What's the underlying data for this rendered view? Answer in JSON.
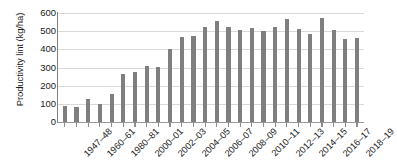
{
  "chart_data": {
    "type": "bar",
    "title": "",
    "xlabel": "",
    "ylabel": "Productivity lint (kg/ha)",
    "ylim": [
      0,
      600
    ],
    "yticks": [
      0,
      100,
      200,
      300,
      400,
      500,
      600
    ],
    "ytick_labels": [
      "0",
      "100",
      "200",
      "300",
      "400",
      "500",
      "600"
    ],
    "grid": true,
    "legend": "none",
    "bar_color": "#7f7f7f",
    "label_every_n_categories": 2,
    "categories": [
      "1947–48",
      "1950–51",
      "1960–61",
      "1970–71",
      "1980–81",
      "1990–91",
      "2000–01",
      "2001–02",
      "2002–03",
      "2003–04",
      "2004–05",
      "2005–06",
      "2006–07",
      "2007–08",
      "2008–09",
      "2009–10",
      "2010–11",
      "2011–12",
      "2012–13",
      "2013–14",
      "2014–15",
      "2015–16",
      "2016–17",
      "2017–18",
      "2018–19",
      "2019–20"
    ],
    "visible_tick_labels": [
      "1947–48",
      "1960–61",
      "1980–81",
      "2000–01",
      "2002–03",
      "2004–05",
      "2006–07",
      "2008–09",
      "2010–11",
      "2012–13",
      "2014–15",
      "2016–17",
      "2018–19"
    ],
    "values": [
      88,
      85,
      125,
      98,
      152,
      267,
      278,
      308,
      305,
      400,
      470,
      472,
      521,
      554,
      525,
      507,
      518,
      499,
      521,
      567,
      512,
      486,
      571,
      504,
      458,
      461
    ]
  }
}
